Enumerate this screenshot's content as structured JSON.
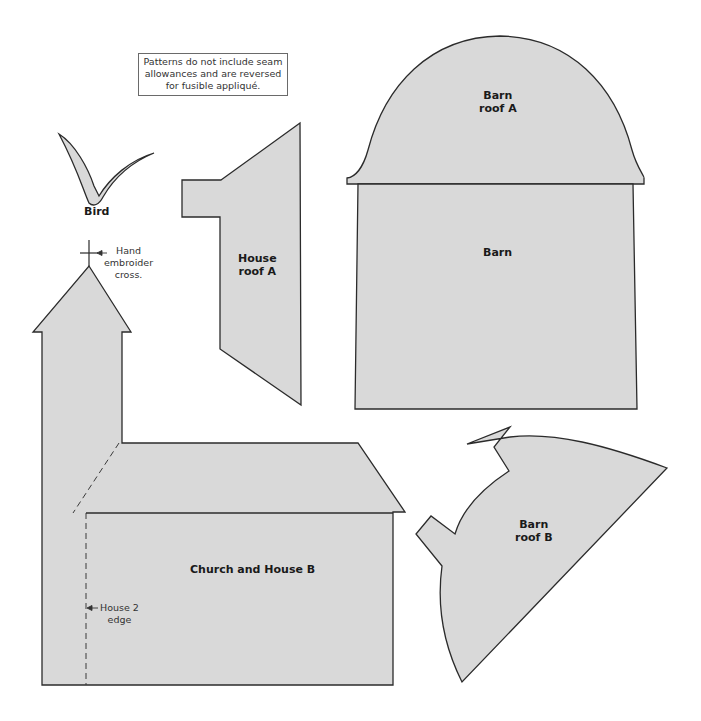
{
  "note": {
    "lines": [
      "Patterns do not include seam",
      "allowances and are reversed",
      "for fusible appliqué."
    ]
  },
  "colors": {
    "fill": "#d9d9d9",
    "stroke": "#2b2b2b",
    "background": "#ffffff",
    "text": "#1a1a1a"
  },
  "pieces": {
    "bird": {
      "label": "Bird"
    },
    "house_roof_a": {
      "lines": [
        "House",
        "roof A"
      ]
    },
    "barn_roof_a": {
      "lines": [
        "Barn",
        "roof A"
      ]
    },
    "barn": {
      "label": "Barn"
    },
    "church_house_b": {
      "label": "Church and House B"
    },
    "barn_roof_b": {
      "lines": [
        "Barn",
        "roof B"
      ]
    }
  },
  "annotations": {
    "cross": {
      "lines": [
        "Hand",
        "embroider",
        "cross."
      ]
    },
    "house2_edge": {
      "lines": [
        "House 2",
        "edge"
      ]
    }
  }
}
